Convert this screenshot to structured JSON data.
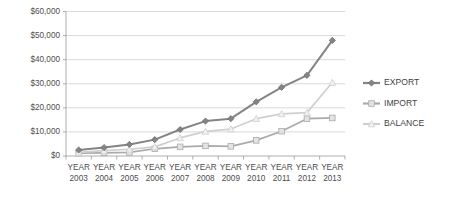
{
  "chart_data": {
    "type": "line",
    "title": "",
    "xlabel": "",
    "ylabel": "",
    "grid": "horizontal",
    "legend_position": "right",
    "ylim": [
      0,
      60000
    ],
    "categories": [
      "YEAR 2003",
      "YEAR 2004",
      "YEAR 2005",
      "YEAR 2006",
      "YEAR 2007",
      "YEAR 2008",
      "YEAR 2009",
      "YEAR 2010",
      "YEAR 2011",
      "YEAR 2012",
      "YEAR 2013"
    ],
    "category_line1": [
      "YEAR",
      "YEAR",
      "YEAR",
      "YEAR",
      "YEAR",
      "YEAR",
      "YEAR",
      "YEAR",
      "YEAR",
      "YEAR",
      "YEAR"
    ],
    "category_line2": [
      "2003",
      "2004",
      "2005",
      "2006",
      "2007",
      "2008",
      "2009",
      "2010",
      "2011",
      "2012",
      "2013"
    ],
    "ytick_labels": [
      "$0",
      "$10,000",
      "$20,000",
      "$30,000",
      "$40,000",
      "$50,000",
      "$60,000"
    ],
    "ytick_values": [
      0,
      10000,
      20000,
      30000,
      40000,
      50000,
      60000
    ],
    "series": [
      {
        "name": "EXPORT",
        "color": "#848484",
        "marker": "diamond",
        "values": [
          2500,
          3500,
          4800,
          6800,
          11000,
          14500,
          15500,
          22500,
          28500,
          33500,
          48000
        ]
      },
      {
        "name": "IMPORT",
        "color": "#aaaaaa",
        "marker": "square",
        "values": [
          1200,
          1300,
          1500,
          3000,
          3800,
          4200,
          4000,
          6500,
          10300,
          15500,
          15800
        ]
      },
      {
        "name": "BALANCE",
        "color": "#cfcfcf",
        "marker": "triangle",
        "values": [
          1500,
          2200,
          2800,
          3800,
          7500,
          10200,
          11200,
          15500,
          17500,
          18000,
          30500
        ]
      }
    ]
  },
  "legend": {
    "items": [
      {
        "label": "EXPORT"
      },
      {
        "label": "IMPORT"
      },
      {
        "label": "BALANCE"
      }
    ]
  },
  "colors": {
    "export": "#848484",
    "import": "#aaaaaa",
    "balance": "#cfcfcf",
    "grid": "#c8c8c8",
    "axis": "#9a9a9a",
    "text": "#4d4d4d",
    "background": "#ffffff"
  }
}
